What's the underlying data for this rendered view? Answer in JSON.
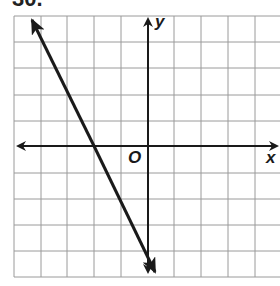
{
  "problem": {
    "number": "30."
  },
  "graph": {
    "x_axis_label": "x",
    "y_axis_label": "y",
    "origin_label": "O",
    "grid": {
      "columns": 10,
      "rows": 10,
      "x_range": [
        -5,
        5
      ],
      "y_range": [
        -5,
        5
      ]
    },
    "line": {
      "equation": "y = -2x - 4",
      "slope": -2,
      "y_intercept": -4,
      "x_intercept": -2,
      "arrows": "both"
    },
    "colors": {
      "grid": "#9a9a9a",
      "axes": "#1a1a1a",
      "line": "#1a1a1a"
    }
  }
}
